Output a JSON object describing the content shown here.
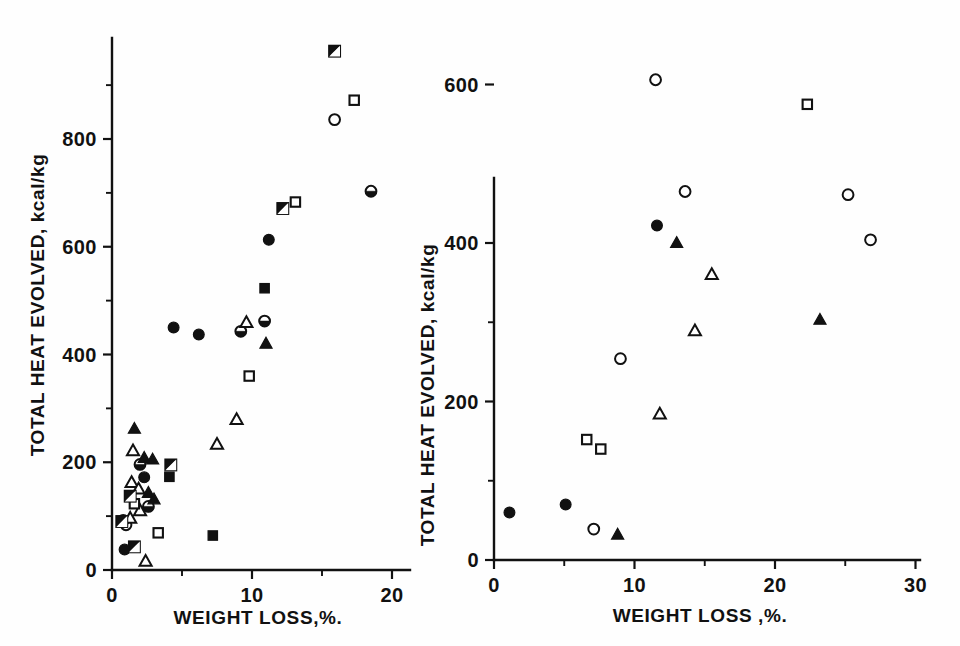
{
  "figure": {
    "background": "#fefefe",
    "ink_color": "#111111",
    "panel_count": 2
  },
  "chart_data": [
    {
      "type": "scatter",
      "panel": "left",
      "title": "",
      "xlabel": "WEIGHT LOSS,%.",
      "ylabel": "TOTAL HEAT EVOLVED, kcal/kg",
      "xlim": [
        0,
        21.5
      ],
      "ylim": [
        0,
        1000
      ],
      "xticks": [
        0,
        10,
        20
      ],
      "xticklabels": [
        "0",
        "10",
        "20"
      ],
      "xminorticks": [
        5,
        15
      ],
      "yticks": [
        0,
        200,
        400,
        600,
        800
      ],
      "yticklabels": [
        "0",
        "200",
        "400",
        "600",
        "800"
      ],
      "yminorticks": [
        100,
        300,
        500,
        700,
        900
      ],
      "grid": false,
      "legend": "none",
      "series": [
        {
          "name": "filled-circle",
          "marker": "filled-circle",
          "points": [
            [
              0.9,
              38
            ],
            [
              2.3,
              172
            ],
            [
              4.4,
              450
            ],
            [
              6.2,
              437
            ],
            [
              11.2,
              613
            ]
          ]
        },
        {
          "name": "open-circle",
          "marker": "open-circle",
          "points": [
            [
              1.0,
              84
            ],
            [
              15.9,
              836
            ]
          ]
        },
        {
          "name": "half-circle",
          "marker": "half-circle",
          "points": [
            [
              0.8,
              92
            ],
            [
              2.0,
              196
            ],
            [
              2.6,
              118
            ],
            [
              9.2,
              443
            ],
            [
              10.9,
              462
            ],
            [
              18.5,
              703
            ]
          ]
        },
        {
          "name": "filled-triangle",
          "marker": "filled-triangle",
          "points": [
            [
              1.6,
              262
            ],
            [
              2.3,
              208
            ],
            [
              2.9,
              205
            ],
            [
              2.6,
              143
            ],
            [
              3.0,
              131
            ],
            [
              11.0,
              420
            ]
          ]
        },
        {
          "name": "open-triangle",
          "marker": "open-triangle",
          "points": [
            [
              1.5,
              221
            ],
            [
              1.4,
              162
            ],
            [
              1.9,
              150
            ],
            [
              2.0,
              110
            ],
            [
              1.3,
              96
            ],
            [
              2.4,
              16
            ],
            [
              7.5,
              233
            ],
            [
              8.9,
              279
            ],
            [
              9.6,
              459
            ]
          ]
        },
        {
          "name": "filled-square",
          "marker": "filled-square",
          "points": [
            [
              4.1,
              173
            ],
            [
              7.2,
              64
            ],
            [
              10.9,
              523
            ]
          ]
        },
        {
          "name": "open-square",
          "marker": "open-square",
          "points": [
            [
              1.6,
              123
            ],
            [
              3.3,
              69
            ],
            [
              9.8,
              360
            ],
            [
              13.1,
              683
            ],
            [
              17.3,
              872
            ]
          ]
        },
        {
          "name": "half-square",
          "marker": "half-square",
          "points": [
            [
              1.3,
              137
            ],
            [
              0.7,
              90
            ],
            [
              1.6,
              43
            ],
            [
              4.2,
              195
            ],
            [
              12.2,
              671
            ],
            [
              15.9,
              963
            ]
          ]
        }
      ]
    },
    {
      "type": "scatter",
      "panel": "right",
      "title": "",
      "xlabel": "WEIGHT LOSS ,%.",
      "ylabel": "TOTAL HEAT EVOLVED, kcal/kg",
      "xlim": [
        0,
        30.5
      ],
      "ylim": [
        0,
        680
      ],
      "xticks": [
        0,
        10,
        20,
        30
      ],
      "xticklabels": [
        "0",
        "10",
        "20",
        "30"
      ],
      "xminorticks": [
        5,
        15,
        25
      ],
      "yticks": [
        0,
        200,
        400,
        600
      ],
      "yticklabels": [
        "0",
        "200",
        "400",
        "600"
      ],
      "yminorticks": [
        100,
        300,
        500
      ],
      "grid": false,
      "legend": "none",
      "series": [
        {
          "name": "filled-circle",
          "marker": "filled-circle",
          "points": [
            [
              1.1,
              60
            ],
            [
              5.1,
              70
            ],
            [
              11.6,
              422
            ]
          ]
        },
        {
          "name": "open-circle",
          "marker": "open-circle",
          "points": [
            [
              7.1,
              39
            ],
            [
              9.0,
              254
            ],
            [
              11.5,
              606
            ],
            [
              13.6,
              465
            ],
            [
              25.2,
              461
            ],
            [
              26.8,
              404
            ]
          ]
        },
        {
          "name": "filled-triangle",
          "marker": "filled-triangle",
          "points": [
            [
              8.8,
              32
            ],
            [
              13.0,
              400
            ],
            [
              23.2,
              303
            ]
          ]
        },
        {
          "name": "open-triangle",
          "marker": "open-triangle",
          "points": [
            [
              11.8,
              184
            ],
            [
              15.5,
              360
            ],
            [
              14.3,
              289
            ]
          ]
        },
        {
          "name": "open-square",
          "marker": "open-square",
          "points": [
            [
              6.6,
              152
            ],
            [
              7.6,
              140
            ],
            [
              22.3,
              575
            ]
          ]
        }
      ]
    }
  ]
}
